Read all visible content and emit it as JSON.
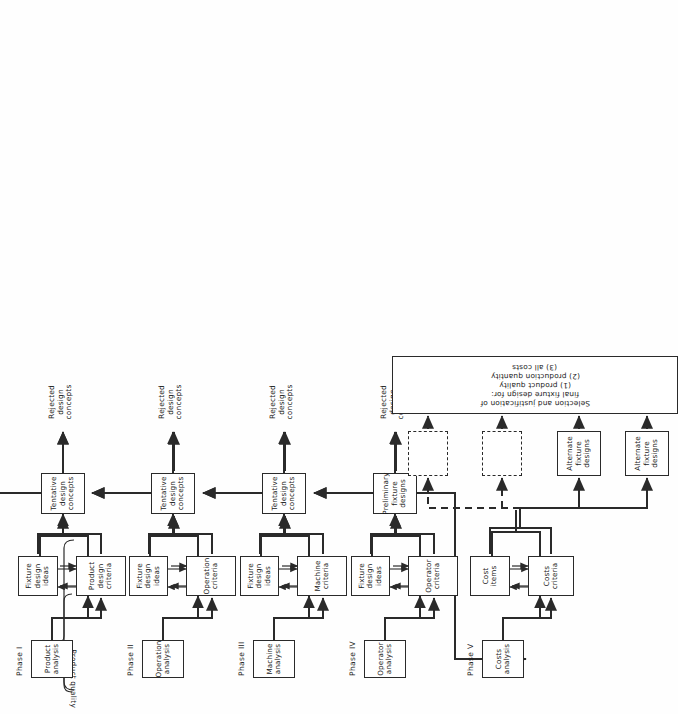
{
  "diagram": {
    "title_label": "Product quality",
    "phases": [
      {
        "id": "phase1",
        "label": "Phase I"
      },
      {
        "id": "phase2",
        "label": "Phase II"
      },
      {
        "id": "phase3",
        "label": "Phase III"
      },
      {
        "id": "phase4",
        "label": "Phase IV"
      },
      {
        "id": "phase5",
        "label": "Phase V"
      }
    ],
    "analysis_boxes": [
      {
        "id": "product-analysis",
        "lines": [
          "Product",
          "analysis"
        ]
      },
      {
        "id": "operation-analysis",
        "lines": [
          "Operation",
          "analysis"
        ]
      },
      {
        "id": "machine-analysis",
        "lines": [
          "Machine",
          "analysis"
        ]
      },
      {
        "id": "operator-analysis",
        "lines": [
          "Operator",
          "analysis"
        ]
      },
      {
        "id": "costs-analysis",
        "lines": [
          "Costs",
          "analysis"
        ]
      }
    ],
    "criteria_boxes": [
      {
        "id": "product-design-criteria",
        "lines": [
          "Product",
          "design",
          "criteria"
        ]
      },
      {
        "id": "operation-criteria",
        "lines": [
          "Operation",
          "criteria"
        ]
      },
      {
        "id": "machine-criteria",
        "lines": [
          "Machine",
          "criteria"
        ]
      },
      {
        "id": "operator-criteria",
        "lines": [
          "Operator",
          "criteria"
        ]
      },
      {
        "id": "costs-criteria",
        "lines": [
          "Costs",
          "criteria"
        ]
      }
    ],
    "ideas_boxes": [
      {
        "id": "fixture-design-ideas-1",
        "lines": [
          "Fixture",
          "design",
          "ideas"
        ]
      },
      {
        "id": "fixture-design-ideas-2",
        "lines": [
          "Fixture",
          "design",
          "ideas"
        ]
      },
      {
        "id": "fixture-design-ideas-3",
        "lines": [
          "Fixture",
          "design",
          "ideas"
        ]
      },
      {
        "id": "fixture-design-ideas-4",
        "lines": [
          "Fixture",
          "design",
          "ideas"
        ]
      },
      {
        "id": "cost-items",
        "lines": [
          "Cost",
          "items"
        ]
      }
    ],
    "concept_boxes": [
      {
        "id": "tentative-design-concepts-1",
        "lines": [
          "Tentative",
          "design",
          "concepts"
        ]
      },
      {
        "id": "tentative-design-concepts-2",
        "lines": [
          "Tentative",
          "design",
          "concepts"
        ]
      },
      {
        "id": "tentative-design-concepts-3",
        "lines": [
          "Tentative",
          "design",
          "concepts"
        ]
      },
      {
        "id": "preliminary-fixture-designs",
        "lines": [
          "Preliminary",
          "fixture",
          "designs"
        ]
      }
    ],
    "rejected_labels": [
      {
        "id": "rejected-1",
        "lines": [
          "Rejected",
          "design",
          "concepts"
        ]
      },
      {
        "id": "rejected-2",
        "lines": [
          "Rejected",
          "design",
          "concepts"
        ]
      },
      {
        "id": "rejected-3",
        "lines": [
          "Rejected",
          "design",
          "concepts"
        ]
      },
      {
        "id": "rejected-4",
        "lines": [
          "Rejected",
          "design",
          "concepts"
        ]
      }
    ],
    "alternate_boxes": [
      {
        "id": "alternate-fixture-designs-1",
        "lines": [
          "Alternate",
          "fixture",
          "designs"
        ]
      },
      {
        "id": "alternate-fixture-designs-2",
        "lines": [
          "Alternate",
          "fixture",
          "designs"
        ]
      }
    ],
    "placeholder_boxes": [
      {
        "id": "placeholder-1",
        "lines": [
          ""
        ]
      },
      {
        "id": "placeholder-2",
        "lines": [
          ""
        ]
      }
    ],
    "final_box": {
      "id": "final-selection",
      "lines": [
        "Selection and justification of",
        "final fixture design for:",
        "(1) product quality",
        "(2) production quantity",
        "(3) all costs"
      ]
    },
    "colors": {
      "line": "#2a2a2a",
      "box_fill": "#ffffff",
      "page": "#fefefe"
    }
  }
}
